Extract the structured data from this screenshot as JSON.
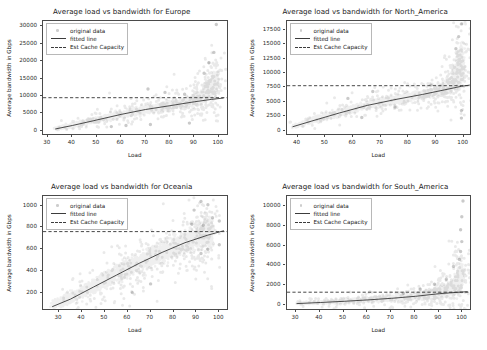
{
  "figure": {
    "background": "#ffffff",
    "width": 487,
    "height": 350,
    "layout": "2x2 grid of scatter subplots"
  },
  "legend": {
    "entries": [
      {
        "label": "original data",
        "key": "scatter-marker",
        "color": "#5a5a5a"
      },
      {
        "label": "fitted line",
        "key": "solid-line",
        "color": "#3c3c3c"
      },
      {
        "label": "Est Cache Capacity",
        "key": "dashed-line",
        "color": "#3c3c3c"
      }
    ]
  },
  "chart_data": [
    {
      "type": "scatter",
      "title": "Average load vs bandwidth for Europe",
      "xlabel": "Load",
      "ylabel": "Average bandwidth in Gbps",
      "xlim": [
        28,
        104
      ],
      "ylim": [
        -1500,
        31500
      ],
      "xticks": [
        30,
        40,
        50,
        60,
        70,
        80,
        90,
        100
      ],
      "yticks": [
        0,
        5000,
        10000,
        15000,
        20000,
        25000,
        30000
      ],
      "grid": false,
      "legend_position": "upper left",
      "est_cache_capacity": 9500,
      "fit_curve": [
        {
          "x": 33,
          "y": 500
        },
        {
          "x": 40,
          "y": 1500
        },
        {
          "x": 50,
          "y": 3100
        },
        {
          "x": 60,
          "y": 4700
        },
        {
          "x": 70,
          "y": 6100
        },
        {
          "x": 80,
          "y": 7200
        },
        {
          "x": 90,
          "y": 8300
        },
        {
          "x": 97,
          "y": 9000
        },
        {
          "x": 102,
          "y": 9400
        }
      ],
      "band": [
        {
          "x": 33,
          "y": 500,
          "spread": 350
        },
        {
          "x": 40,
          "y": 1550,
          "spread": 500
        },
        {
          "x": 50,
          "y": 3100,
          "spread": 650
        },
        {
          "x": 60,
          "y": 4700,
          "spread": 800
        },
        {
          "x": 70,
          "y": 6050,
          "spread": 900
        },
        {
          "x": 80,
          "y": 7200,
          "spread": 1000
        },
        {
          "x": 88,
          "y": 8300,
          "spread": 1100
        },
        {
          "x": 93,
          "y": 9700,
          "spread": 1400
        },
        {
          "x": 97,
          "y": 12500,
          "spread": 2300
        },
        {
          "x": 99,
          "y": 14500,
          "spread": 2200
        }
      ],
      "outliers": [
        {
          "x": 99,
          "y": 30500
        },
        {
          "x": 98,
          "y": 22500
        },
        {
          "x": 96,
          "y": 19500
        },
        {
          "x": 71,
          "y": 12000
        },
        {
          "x": 78,
          "y": 11000
        },
        {
          "x": 86,
          "y": 10500
        },
        {
          "x": 56,
          "y": 1200
        },
        {
          "x": 62,
          "y": 1500
        },
        {
          "x": 72,
          "y": 1800
        },
        {
          "x": 88,
          "y": 2200
        },
        {
          "x": 94,
          "y": 16500
        }
      ],
      "n_points": 4200
    },
    {
      "type": "scatter",
      "title": "Average load vs bandwidth for North_America",
      "xlabel": "Load",
      "ylabel": "Average bandwidth in Gbps",
      "xlim": [
        36,
        103
      ],
      "ylim": [
        -900,
        19000
      ],
      "xticks": [
        40,
        50,
        60,
        70,
        80,
        90,
        100
      ],
      "yticks": [
        0,
        2500,
        5000,
        7500,
        10000,
        12500,
        15000,
        17500
      ],
      "grid": false,
      "legend_position": "upper left",
      "est_cache_capacity": 7800,
      "fit_curve": [
        {
          "x": 38,
          "y": 700
        },
        {
          "x": 45,
          "y": 1700
        },
        {
          "x": 55,
          "y": 3100
        },
        {
          "x": 65,
          "y": 4400
        },
        {
          "x": 75,
          "y": 5400
        },
        {
          "x": 85,
          "y": 6300
        },
        {
          "x": 93,
          "y": 7100
        },
        {
          "x": 99,
          "y": 7700
        },
        {
          "x": 102,
          "y": 7900
        }
      ],
      "band": [
        {
          "x": 38,
          "y": 700,
          "spread": 250
        },
        {
          "x": 45,
          "y": 1750,
          "spread": 400
        },
        {
          "x": 55,
          "y": 3150,
          "spread": 520
        },
        {
          "x": 65,
          "y": 4400,
          "spread": 600
        },
        {
          "x": 75,
          "y": 5400,
          "spread": 620
        },
        {
          "x": 85,
          "y": 6300,
          "spread": 650
        },
        {
          "x": 92,
          "y": 7100,
          "spread": 700
        },
        {
          "x": 96,
          "y": 8400,
          "spread": 1100
        },
        {
          "x": 98,
          "y": 10500,
          "spread": 2200
        },
        {
          "x": 99.5,
          "y": 12000,
          "spread": 2600
        }
      ],
      "outliers": [
        {
          "x": 99,
          "y": 18500
        },
        {
          "x": 98,
          "y": 16300
        },
        {
          "x": 97,
          "y": 14200
        },
        {
          "x": 67,
          "y": 6800
        },
        {
          "x": 58,
          "y": 5600
        },
        {
          "x": 75,
          "y": 4100
        },
        {
          "x": 63,
          "y": 2300
        },
        {
          "x": 99,
          "y": 2200
        },
        {
          "x": 99,
          "y": 3500
        },
        {
          "x": 88,
          "y": 7900
        }
      ],
      "n_points": 4200
    },
    {
      "type": "scatter",
      "title": "Average load vs bandwidth for Oceania",
      "xlabel": "Load",
      "ylabel": "Average bandwidth in Gbps",
      "xlim": [
        23,
        104
      ],
      "ylim": [
        30,
        1090
      ],
      "xticks": [
        30,
        40,
        50,
        60,
        70,
        80,
        90,
        100
      ],
      "yticks": [
        200,
        400,
        600,
        800,
        1000
      ],
      "grid": false,
      "legend_position": "upper left",
      "est_cache_capacity": 762,
      "fit_curve": [
        {
          "x": 27,
          "y": 70
        },
        {
          "x": 35,
          "y": 140
        },
        {
          "x": 45,
          "y": 250
        },
        {
          "x": 55,
          "y": 360
        },
        {
          "x": 65,
          "y": 470
        },
        {
          "x": 75,
          "y": 570
        },
        {
          "x": 85,
          "y": 660
        },
        {
          "x": 95,
          "y": 730
        },
        {
          "x": 102,
          "y": 770
        }
      ],
      "band": [
        {
          "x": 27,
          "y": 80,
          "spread": 30
        },
        {
          "x": 35,
          "y": 150,
          "spread": 45
        },
        {
          "x": 45,
          "y": 255,
          "spread": 60
        },
        {
          "x": 55,
          "y": 365,
          "spread": 70
        },
        {
          "x": 65,
          "y": 470,
          "spread": 75
        },
        {
          "x": 75,
          "y": 570,
          "spread": 80
        },
        {
          "x": 85,
          "y": 665,
          "spread": 85
        },
        {
          "x": 92,
          "y": 720,
          "spread": 90
        },
        {
          "x": 97,
          "y": 780,
          "spread": 110
        }
      ],
      "outliers": [
        {
          "x": 92,
          "y": 1040
        },
        {
          "x": 95,
          "y": 1010
        },
        {
          "x": 89,
          "y": 960
        },
        {
          "x": 97,
          "y": 890
        },
        {
          "x": 100,
          "y": 860
        },
        {
          "x": 93,
          "y": 820
        },
        {
          "x": 100,
          "y": 640
        },
        {
          "x": 95,
          "y": 600
        },
        {
          "x": 92,
          "y": 560
        },
        {
          "x": 62,
          "y": 200
        },
        {
          "x": 70,
          "y": 280
        },
        {
          "x": 88,
          "y": 830
        }
      ],
      "n_points": 4200
    },
    {
      "type": "scatter",
      "title": "Average load vs bandwidth for South_America",
      "xlabel": "Load",
      "ylabel": "Average bandwidth in Gbps",
      "xlim": [
        26,
        104
      ],
      "ylim": [
        -600,
        11000
      ],
      "xticks": [
        30,
        40,
        50,
        60,
        70,
        80,
        90,
        100
      ],
      "yticks": [
        0,
        2000,
        4000,
        6000,
        8000,
        10000
      ],
      "grid": false,
      "legend_position": "upper left",
      "est_cache_capacity": 1300,
      "fit_curve": [
        {
          "x": 30,
          "y": 150
        },
        {
          "x": 40,
          "y": 260
        },
        {
          "x": 50,
          "y": 380
        },
        {
          "x": 60,
          "y": 520
        },
        {
          "x": 70,
          "y": 680
        },
        {
          "x": 80,
          "y": 880
        },
        {
          "x": 90,
          "y": 1150
        },
        {
          "x": 97,
          "y": 1280
        },
        {
          "x": 102,
          "y": 1350
        }
      ],
      "band": [
        {
          "x": 31,
          "y": 160,
          "spread": 90
        },
        {
          "x": 40,
          "y": 270,
          "spread": 120
        },
        {
          "x": 50,
          "y": 390,
          "spread": 150
        },
        {
          "x": 60,
          "y": 530,
          "spread": 180
        },
        {
          "x": 70,
          "y": 690,
          "spread": 210
        },
        {
          "x": 80,
          "y": 900,
          "spread": 260
        },
        {
          "x": 88,
          "y": 1150,
          "spread": 330
        },
        {
          "x": 94,
          "y": 1500,
          "spread": 500
        },
        {
          "x": 98,
          "y": 2300,
          "spread": 900
        },
        {
          "x": 99.5,
          "y": 3100,
          "spread": 1100
        }
      ],
      "outliers": [
        {
          "x": 100,
          "y": 10500
        },
        {
          "x": 99.5,
          "y": 8900
        },
        {
          "x": 99,
          "y": 7600
        },
        {
          "x": 99.5,
          "y": 6400
        },
        {
          "x": 99,
          "y": 5400
        },
        {
          "x": 98.5,
          "y": 4600
        },
        {
          "x": 96,
          "y": 3900
        },
        {
          "x": 93,
          "y": 2600
        },
        {
          "x": 88,
          "y": 2100
        },
        {
          "x": 82,
          "y": 1600
        },
        {
          "x": 75,
          "y": 1200
        }
      ],
      "n_points": 4200
    }
  ]
}
